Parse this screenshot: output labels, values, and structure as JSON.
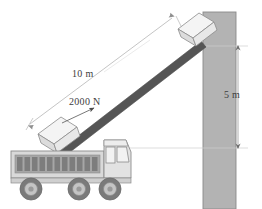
{
  "diagram": {
    "labels": {
      "ramp_length": "10 m",
      "applied_force": "2000 N",
      "wall_height": "5 m"
    },
    "colors": {
      "wall_fill": "#b3b3b3",
      "wall_stroke": "#808080",
      "ramp_fill": "#555555",
      "truck_body": "#d9d9d9",
      "truck_bed": "#a6a6a6",
      "truck_stroke": "#8c8c8c",
      "wheel_tire": "#7a7a7a",
      "wheel_hub": "#c4c4c4",
      "box_fill": "#ededed",
      "box_stroke": "#8c8c8c",
      "dim_line": "#9a9a9a",
      "ref_line": "#cfcfcf",
      "text": "#3d3d3d"
    },
    "elements": {
      "wall": "vertical gray column at right",
      "ramp": "thick dark diagonal incline",
      "box_upper": "crate near top of ramp at wall",
      "box_lower": "crate at bottom of ramp above truck bed",
      "truck": "dump truck with three wheels and ribbed cargo bed",
      "force_arrow": "arrow pointing up the incline",
      "dimension_10m": "double arrow parallel to ramp",
      "dimension_5m": "vertical double arrow at right of wall"
    }
  }
}
